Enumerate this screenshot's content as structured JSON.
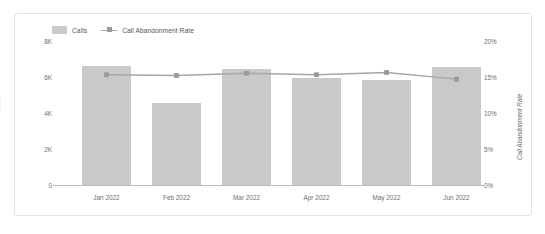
{
  "legend": {
    "items": [
      {
        "label": "Calls",
        "marker": "bar-swatch-icon",
        "color": "#c9c9c9"
      },
      {
        "label": "Call Abandonment Rate",
        "marker": "line-marker-icon",
        "color": "#a6a6a6"
      }
    ]
  },
  "axes": {
    "left_title": "Calls",
    "right_title": "Call Abandonment Rate",
    "left_ticks": [
      "8K",
      "6K",
      "4K",
      "2K",
      "0"
    ],
    "right_ticks": [
      "20%",
      "15%",
      "10%",
      "5%",
      "0%"
    ]
  },
  "chart_data": {
    "type": "bar",
    "title": "",
    "xlabel": "",
    "ylabel": "Calls",
    "y2label": "Call Abandonment Rate",
    "categories": [
      "Jan 2022",
      "Feb 2022",
      "Mar 2022",
      "Apr 2022",
      "May 2022",
      "Jun 2022"
    ],
    "ylim": [
      0,
      8000
    ],
    "y2lim": [
      0,
      20
    ],
    "ytick_labels": [
      "0",
      "2K",
      "4K",
      "6K",
      "8K"
    ],
    "ytick_values": [
      0,
      2000,
      4000,
      6000,
      8000
    ],
    "y2tick_labels": [
      "0%",
      "5%",
      "10%",
      "15%",
      "20%"
    ],
    "y2tick_values": [
      0,
      5,
      10,
      15,
      20
    ],
    "grid": false,
    "legend_position": "top-left",
    "series": [
      {
        "name": "Calls",
        "type": "bar",
        "axis": "left",
        "color": "#c9c9c9",
        "values": [
          6400,
          4400,
          6250,
          5750,
          5650,
          6350
        ]
      },
      {
        "name": "Call Abandonment Rate",
        "type": "line",
        "axis": "right",
        "color": "#a6a6a6",
        "unit": "%",
        "values": [
          14.8,
          14.7,
          15.0,
          14.8,
          15.1,
          14.2
        ]
      }
    ]
  }
}
